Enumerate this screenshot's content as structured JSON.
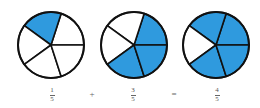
{
  "figure": {
    "colors": {
      "filled": "#2f9ade",
      "empty": "#ffffff",
      "stroke": "#111111",
      "text": "#555555"
    },
    "pies": [
      {
        "id": "pie-one-fifth",
        "cx": 51,
        "cy": 45,
        "r": 33,
        "slices": 5,
        "filled_slices": [
          1
        ],
        "fraction": {
          "numerator": "1",
          "denominator": "5"
        }
      },
      {
        "id": "pie-three-fifths",
        "cx": 134,
        "cy": 45,
        "r": 33,
        "slices": 5,
        "filled_slices": [
          0,
          3,
          4
        ],
        "fraction": {
          "numerator": "3",
          "denominator": "5"
        }
      },
      {
        "id": "pie-four-fifths",
        "cx": 216,
        "cy": 45,
        "r": 33,
        "slices": 5,
        "filled_slices": [
          0,
          1,
          3,
          4
        ],
        "fraction": {
          "numerator": "4",
          "denominator": "5"
        }
      }
    ],
    "operators": {
      "plus": "+",
      "equals": "="
    },
    "equation": "1/5 + 3/5 = 4/5"
  }
}
